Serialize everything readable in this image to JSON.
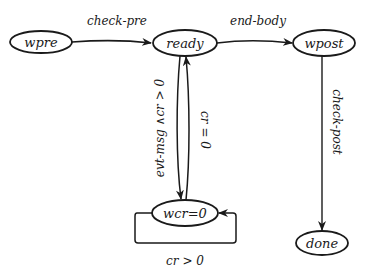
{
  "diagram": {
    "type": "state-machine",
    "colors": {
      "stroke": "#1a1a1a",
      "background": "#ffffff",
      "text": "#1a1a1a"
    },
    "states": [
      {
        "id": "wpre",
        "label": "wpre"
      },
      {
        "id": "ready",
        "label": "ready"
      },
      {
        "id": "wpost",
        "label": "wpost"
      },
      {
        "id": "wcr0",
        "label": "wcr=0"
      },
      {
        "id": "done",
        "label": "done"
      }
    ],
    "transitions": [
      {
        "from": "wpre",
        "to": "ready",
        "label": "check-pre"
      },
      {
        "from": "ready",
        "to": "wpost",
        "label": "end-body"
      },
      {
        "from": "wpost",
        "to": "done",
        "label": "check-post"
      },
      {
        "from": "ready",
        "to": "wcr0",
        "label": "evt-msg ∧cr > 0"
      },
      {
        "from": "wcr0",
        "to": "ready",
        "label": "cr = 0"
      },
      {
        "from": "wcr0",
        "to": "wcr0",
        "label": "cr > 0"
      }
    ]
  }
}
